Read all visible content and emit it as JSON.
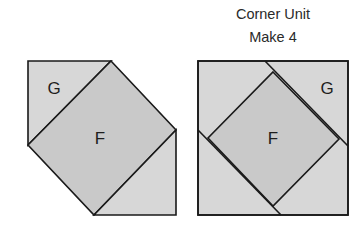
{
  "caption": {
    "line1": "Corner Unit",
    "line2": "Make 4"
  },
  "colors": {
    "light_fill": "#d7d7d7",
    "dark_fill": "#c9c9c9",
    "stroke": "#1a1a1a",
    "label": "#1e1e1e"
  },
  "left_unit": {
    "labels": {
      "g": "G",
      "f": "F"
    }
  },
  "right_unit": {
    "labels": {
      "g": "G",
      "f": "F"
    }
  }
}
